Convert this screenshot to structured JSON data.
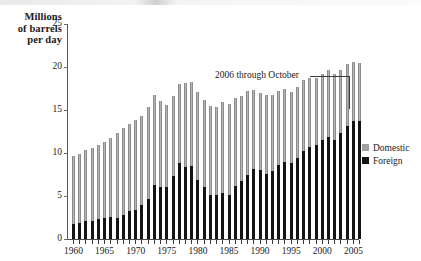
{
  "axis_title": {
    "line1": "Millions",
    "line2": "of barrels",
    "line3": "per day"
  },
  "annotation": {
    "text": "2006 through October"
  },
  "legend": {
    "position": "right",
    "items": [
      {
        "label": "Domestic",
        "color": "#a0a0a0",
        "icon": "square-swatch-gray"
      },
      {
        "label": "Foreign",
        "color": "#141414",
        "icon": "square-swatch-black"
      }
    ]
  },
  "chart_data": {
    "type": "bar",
    "subtype": "stacked-vertical",
    "title": "",
    "subtitle": "",
    "xlabel": "",
    "ylabel": "Millions of barrels per day",
    "ylim": [
      0,
      25
    ],
    "yticks": [
      0,
      5,
      10,
      15,
      20,
      25
    ],
    "grid": false,
    "legend_position": "right",
    "xtick_labels": [
      "1960",
      "1965",
      "1970",
      "1975",
      "1980",
      "1985",
      "1990",
      "1995",
      "2000",
      "2005"
    ],
    "xtick_step_years": 5,
    "minor_ticks_every_year": true,
    "annotations": [
      {
        "text": "2006 through October",
        "points_to_category": "2006"
      }
    ],
    "categories": [
      "1960",
      "1961",
      "1962",
      "1963",
      "1964",
      "1965",
      "1966",
      "1967",
      "1968",
      "1969",
      "1970",
      "1971",
      "1972",
      "1973",
      "1974",
      "1975",
      "1976",
      "1977",
      "1978",
      "1979",
      "1980",
      "1981",
      "1982",
      "1983",
      "1984",
      "1985",
      "1986",
      "1987",
      "1988",
      "1989",
      "1990",
      "1991",
      "1992",
      "1993",
      "1994",
      "1995",
      "1996",
      "1997",
      "1998",
      "1999",
      "2000",
      "2001",
      "2002",
      "2003",
      "2004",
      "2005",
      "2006"
    ],
    "series": [
      {
        "name": "Foreign",
        "color": "#141414",
        "values": [
          1.8,
          1.9,
          2.1,
          2.1,
          2.3,
          2.5,
          2.6,
          2.5,
          2.8,
          3.2,
          3.4,
          3.9,
          4.7,
          6.3,
          6.1,
          6.1,
          7.3,
          8.8,
          8.4,
          8.5,
          6.9,
          6.0,
          5.1,
          5.1,
          5.4,
          5.1,
          6.2,
          6.7,
          7.4,
          8.1,
          8.0,
          7.6,
          7.9,
          8.6,
          9.0,
          8.8,
          9.4,
          10.2,
          10.7,
          10.9,
          11.5,
          11.9,
          11.5,
          12.3,
          13.1,
          13.7,
          13.7
        ]
      },
      {
        "name": "Domestic",
        "color": "#a0a0a0",
        "values": [
          7.9,
          8.0,
          8.2,
          8.5,
          8.6,
          8.8,
          9.2,
          9.8,
          10.1,
          10.2,
          10.4,
          10.4,
          10.6,
          10.4,
          9.9,
          9.5,
          9.3,
          9.2,
          9.7,
          9.8,
          10.2,
          10.2,
          10.4,
          10.3,
          10.5,
          10.6,
          10.2,
          9.9,
          9.8,
          9.2,
          9.0,
          9.2,
          8.9,
          8.6,
          8.4,
          8.3,
          8.3,
          8.3,
          8.0,
          7.8,
          7.7,
          7.7,
          7.7,
          7.4,
          7.2,
          6.9,
          6.8
        ]
      }
    ],
    "totals": [
      9.7,
      9.9,
      10.3,
      10.6,
      10.9,
      11.3,
      11.8,
      12.3,
      12.9,
      13.4,
      13.8,
      14.3,
      15.3,
      16.7,
      16.0,
      15.6,
      16.6,
      18.0,
      18.1,
      18.3,
      17.1,
      16.2,
      15.5,
      15.4,
      15.9,
      15.7,
      16.4,
      16.6,
      17.2,
      17.3,
      17.0,
      16.8,
      16.8,
      17.2,
      17.4,
      17.1,
      17.7,
      18.5,
      18.7,
      18.7,
      19.2,
      19.6,
      19.2,
      19.7,
      20.3,
      20.6,
      20.5
    ]
  }
}
